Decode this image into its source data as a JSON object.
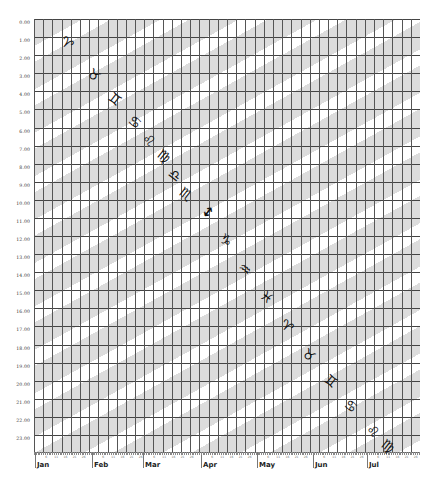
{
  "chart_data": {
    "type": "scatter",
    "title": "",
    "xlabel": "",
    "ylabel": "",
    "y_ticks": [
      "0.00",
      "1.00",
      "2.00",
      "3.00",
      "4.00",
      "5.00",
      "6.00",
      "7.00",
      "8.00",
      "9.00",
      "10.00",
      "11.00",
      "12.00",
      "13.00",
      "14.00",
      "15.00",
      "16.00",
      "17.00",
      "18.00",
      "19.00",
      "20.00",
      "21.00",
      "22.00",
      "23.00"
    ],
    "ylim": [
      0,
      24
    ],
    "x_months": [
      "Jan",
      "Feb",
      "Mar",
      "Apr",
      "May",
      "Jun",
      "Jul"
    ],
    "x_day_ticks": [
      "6",
      "11",
      "16",
      "21",
      "26"
    ],
    "grid": true,
    "background": "diagonal gray stripes rising left-to-right",
    "points": [
      {
        "sign": "Aries",
        "glyph": "♈",
        "x_day": 18,
        "y_hour": 1.3
      },
      {
        "sign": "Taurus",
        "glyph": "♉",
        "x_day": 33,
        "y_hour": 3.1
      },
      {
        "sign": "Gemini",
        "glyph": "♊",
        "x_day": 44,
        "y_hour": 4.4
      },
      {
        "sign": "Cancer",
        "glyph": "♋",
        "x_day": 55,
        "y_hour": 5.7
      },
      {
        "sign": "Leo",
        "glyph": "♌",
        "x_day": 63,
        "y_hour": 6.7
      },
      {
        "sign": "Virgo",
        "glyph": "♍",
        "x_day": 71,
        "y_hour": 7.6
      },
      {
        "sign": "Libra",
        "glyph": "♎",
        "x_day": 77,
        "y_hour": 8.6
      },
      {
        "sign": "Scorpio",
        "glyph": "♏",
        "x_day": 83,
        "y_hour": 9.7
      },
      {
        "sign": "Sagittarius",
        "glyph": "↕",
        "x_day": 95,
        "y_hour": 10.7
      },
      {
        "sign": "Capricorn",
        "glyph": "♑",
        "x_day": 105,
        "y_hour": 12.2
      },
      {
        "sign": "Aquarius",
        "glyph": "♒",
        "x_day": 115,
        "y_hour": 13.8
      },
      {
        "sign": "Pisces",
        "glyph": "♓",
        "x_day": 127,
        "y_hour": 15.4
      },
      {
        "sign": "Aries",
        "glyph": "♈",
        "x_day": 138,
        "y_hour": 17.0
      },
      {
        "sign": "Taurus",
        "glyph": "♉",
        "x_day": 150,
        "y_hour": 18.6
      },
      {
        "sign": "Gemini",
        "glyph": "♊",
        "x_day": 162,
        "y_hour": 20.0
      },
      {
        "sign": "Cancer",
        "glyph": "♋",
        "x_day": 173,
        "y_hour": 21.4
      },
      {
        "sign": "Leo",
        "glyph": "♌",
        "x_day": 185,
        "y_hour": 22.8
      },
      {
        "sign": "Virgo",
        "glyph": "♍",
        "x_day": 193,
        "y_hour": 23.6
      }
    ]
  }
}
